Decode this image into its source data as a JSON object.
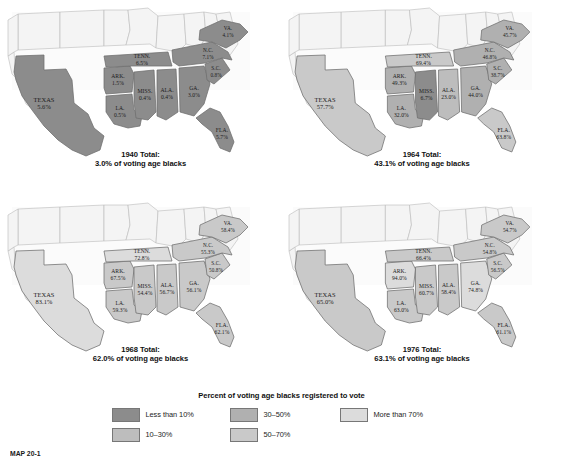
{
  "figure": {
    "legend_title": "Percent of voting age blacks registered to vote",
    "caption_label": "MAP 20-1",
    "caption_text": ""
  },
  "colors": {
    "cat_lt10": "#8c8c8c",
    "cat_10_30": "#bdbdbd",
    "cat_30_50": "#b0b0b0",
    "cat_50_70": "#c9c9c9",
    "cat_gt70": "#dcdcdc",
    "non_south": "#f4f4f4",
    "outline": "#6e6e6e",
    "text": "#1b1b1b"
  },
  "legend": {
    "items": [
      {
        "label": "Less than 10%",
        "color_key": "cat_lt10",
        "swatch": "#8c8c8c"
      },
      {
        "label": "10–30%",
        "color_key": "cat_10_30",
        "swatch": "#bdbdbd"
      },
      {
        "label": "30–50%",
        "color_key": "cat_30_50",
        "swatch": "#b0b0b0"
      },
      {
        "label": "50–70%",
        "color_key": "cat_50_70",
        "swatch": "#c9c9c9"
      },
      {
        "label": "More than 70%",
        "color_key": "cat_gt70",
        "swatch": "#dcdcdc"
      }
    ]
  },
  "chart_data": {
    "type": "map",
    "title": "Percent of voting age blacks registered to vote",
    "legend_position": "bottom",
    "categories": [
      "Less than 10%",
      "10–30%",
      "30–50%",
      "50–70%",
      "More than 70%"
    ],
    "panels": [
      {
        "year": "1940",
        "total_line1": "1940 Total:",
        "total_line2": "3.0% of voting age blacks",
        "total_value": 3.0,
        "states": [
          {
            "abbr": "TEXAS",
            "value": "5.6%",
            "num": 5.6,
            "fill": "#8c8c8c"
          },
          {
            "abbr": "ARK.",
            "value": "1.5%",
            "num": 1.5,
            "fill": "#8c8c8c"
          },
          {
            "abbr": "LA.",
            "value": "0.5%",
            "num": 0.5,
            "fill": "#8c8c8c"
          },
          {
            "abbr": "MISS.",
            "value": "0.4%",
            "num": 0.4,
            "fill": "#8c8c8c"
          },
          {
            "abbr": "ALA.",
            "value": "0.4%",
            "num": 0.4,
            "fill": "#8c8c8c"
          },
          {
            "abbr": "TENN.",
            "value": "6.5%",
            "num": 6.5,
            "fill": "#8c8c8c"
          },
          {
            "abbr": "GA.",
            "value": "3.0%",
            "num": 3.0,
            "fill": "#8c8c8c"
          },
          {
            "abbr": "FLA.",
            "value": "5.7%",
            "num": 5.7,
            "fill": "#8c8c8c"
          },
          {
            "abbr": "S.C.",
            "value": "0.8%",
            "num": 0.8,
            "fill": "#8c8c8c"
          },
          {
            "abbr": "N.C.",
            "value": "7.1%",
            "num": 7.1,
            "fill": "#8c8c8c"
          },
          {
            "abbr": "VA.",
            "value": "4.1%",
            "num": 4.1,
            "fill": "#8c8c8c"
          }
        ]
      },
      {
        "year": "1964",
        "total_line1": "1964 Total:",
        "total_line2": "43.1% of voting age blacks",
        "total_value": 43.1,
        "states": [
          {
            "abbr": "TEXAS",
            "value": "57.7%",
            "num": 57.7,
            "fill": "#c9c9c9"
          },
          {
            "abbr": "ARK.",
            "value": "49.3%",
            "num": 49.3,
            "fill": "#b0b0b0"
          },
          {
            "abbr": "LA.",
            "value": "32.0%",
            "num": 32.0,
            "fill": "#b0b0b0"
          },
          {
            "abbr": "MISS.",
            "value": "6.7%",
            "num": 6.7,
            "fill": "#8c8c8c"
          },
          {
            "abbr": "ALA.",
            "value": "23.0%",
            "num": 23.0,
            "fill": "#bdbdbd"
          },
          {
            "abbr": "TENN.",
            "value": "69.4%",
            "num": 69.4,
            "fill": "#c9c9c9"
          },
          {
            "abbr": "GA.",
            "value": "44.0%",
            "num": 44.0,
            "fill": "#b0b0b0"
          },
          {
            "abbr": "FLA.",
            "value": "63.8%",
            "num": 63.8,
            "fill": "#c9c9c9"
          },
          {
            "abbr": "S.C.",
            "value": "38.7%",
            "num": 38.7,
            "fill": "#b0b0b0"
          },
          {
            "abbr": "N.C.",
            "value": "46.8%",
            "num": 46.8,
            "fill": "#b0b0b0"
          },
          {
            "abbr": "VA.",
            "value": "45.7%",
            "num": 45.7,
            "fill": "#b0b0b0"
          }
        ]
      },
      {
        "year": "1968",
        "total_line1": "1968 Total:",
        "total_line2": "62.0% of voting age blacks",
        "total_value": 62.0,
        "states": [
          {
            "abbr": "TEXAS",
            "value": "83.1%",
            "num": 83.1,
            "fill": "#dcdcdc"
          },
          {
            "abbr": "ARK.",
            "value": "67.5%",
            "num": 67.5,
            "fill": "#c9c9c9"
          },
          {
            "abbr": "LA.",
            "value": "59.3%",
            "num": 59.3,
            "fill": "#c9c9c9"
          },
          {
            "abbr": "MISS.",
            "value": "54.4%",
            "num": 54.4,
            "fill": "#c9c9c9"
          },
          {
            "abbr": "ALA.",
            "value": "56.7%",
            "num": 56.7,
            "fill": "#c9c9c9"
          },
          {
            "abbr": "TENN.",
            "value": "72.8%",
            "num": 72.8,
            "fill": "#dcdcdc"
          },
          {
            "abbr": "GA.",
            "value": "56.1%",
            "num": 56.1,
            "fill": "#c9c9c9"
          },
          {
            "abbr": "FLA.",
            "value": "62.1%",
            "num": 62.1,
            "fill": "#c9c9c9"
          },
          {
            "abbr": "S.C.",
            "value": "50.8%",
            "num": 50.8,
            "fill": "#c9c9c9"
          },
          {
            "abbr": "N.C.",
            "value": "55.3%",
            "num": 55.3,
            "fill": "#c9c9c9"
          },
          {
            "abbr": "VA.",
            "value": "58.4%",
            "num": 58.4,
            "fill": "#c9c9c9"
          }
        ]
      },
      {
        "year": "1976",
        "total_line1": "1976 Total:",
        "total_line2": "63.1% of voting age blacks",
        "total_value": 63.1,
        "states": [
          {
            "abbr": "TEXAS",
            "value": "65.0%",
            "num": 65.0,
            "fill": "#c9c9c9"
          },
          {
            "abbr": "ARK.",
            "value": "94.0%",
            "num": 94.0,
            "fill": "#dcdcdc"
          },
          {
            "abbr": "LA.",
            "value": "63.0%",
            "num": 63.0,
            "fill": "#c9c9c9"
          },
          {
            "abbr": "MISS.",
            "value": "60.7%",
            "num": 60.7,
            "fill": "#c9c9c9"
          },
          {
            "abbr": "ALA.",
            "value": "58.4%",
            "num": 58.4,
            "fill": "#c9c9c9"
          },
          {
            "abbr": "TENN.",
            "value": "66.4%",
            "num": 66.4,
            "fill": "#c9c9c9"
          },
          {
            "abbr": "GA.",
            "value": "74.8%",
            "num": 74.8,
            "fill": "#dcdcdc"
          },
          {
            "abbr": "FLA.",
            "value": "61.1%",
            "num": 61.1,
            "fill": "#c9c9c9"
          },
          {
            "abbr": "S.C.",
            "value": "56.5%",
            "num": 56.5,
            "fill": "#c9c9c9"
          },
          {
            "abbr": "N.C.",
            "value": "54.8%",
            "num": 54.8,
            "fill": "#c9c9c9"
          },
          {
            "abbr": "VA.",
            "value": "54.7%",
            "num": 54.7,
            "fill": "#c9c9c9"
          }
        ]
      }
    ]
  }
}
